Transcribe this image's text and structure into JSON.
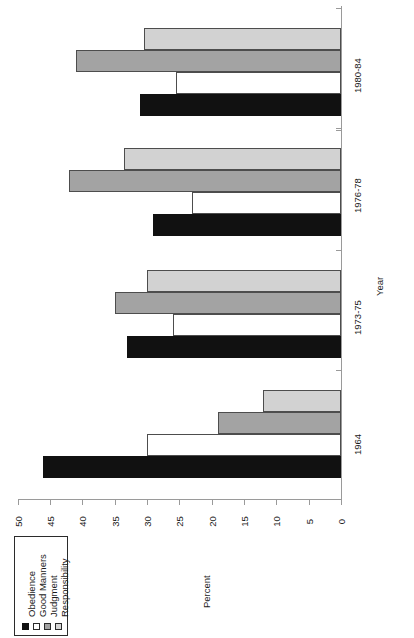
{
  "chart_data": {
    "type": "bar",
    "orientation": "rotated-90",
    "title": "",
    "xlabel": "Year",
    "ylabel": "Percent",
    "categories": [
      "1964",
      "1973-75",
      "1976-78",
      "1980-84"
    ],
    "series": [
      {
        "name": "Obedience",
        "color": "#111111",
        "values": [
          46,
          33,
          29,
          31
        ]
      },
      {
        "name": "Good Manners",
        "color": "#ffffff",
        "values": [
          30,
          26,
          23,
          25.5
        ]
      },
      {
        "name": "Judgment",
        "color": "#a3a3a3",
        "values": [
          19,
          35,
          42,
          41
        ]
      },
      {
        "name": "Responsibility",
        "color": "#d2d2d2",
        "values": [
          12,
          30,
          33.5,
          30.5
        ]
      }
    ],
    "ylim": [
      0,
      50
    ],
    "yticks": [
      0,
      5,
      10,
      15,
      20,
      25,
      30,
      35,
      40,
      45,
      50
    ],
    "ytick_labels": [
      "0",
      "5",
      "10",
      "15",
      "20",
      "25",
      "30",
      "35",
      "40",
      "45",
      "50"
    ],
    "grid": false,
    "legend_position": "bottom-left",
    "axis_value_zero_at": "right"
  },
  "legend": {
    "entries": [
      {
        "label": "Obedience",
        "swatch": "legend-swatch-obedience"
      },
      {
        "label": "Good Manners",
        "swatch": "legend-swatch-good-manners"
      },
      {
        "label": "Judgment",
        "swatch": "legend-swatch-judgment"
      },
      {
        "label": "Responsibility",
        "swatch": "legend-swatch-responsibility"
      }
    ]
  }
}
